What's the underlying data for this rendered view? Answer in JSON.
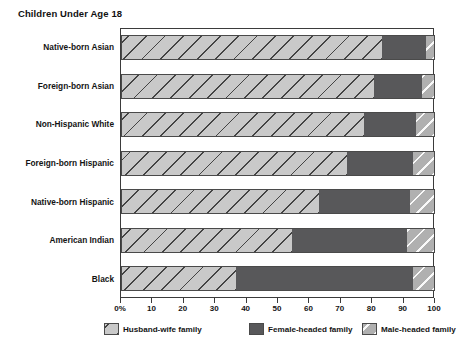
{
  "chart_data": {
    "type": "bar",
    "title": "Children Under Age 18",
    "subtype": "horizontal stacked bar (100% stacked)",
    "xlabel": "",
    "ylabel": "",
    "xlim": [
      0,
      100
    ],
    "grid": false,
    "legend_position": "bottom",
    "orientation": "horizontal",
    "stacked": true,
    "categories": [
      "Native-born Asian",
      "Foreign-born Asian",
      "Non-Hispanic White",
      "Foreign-born Hispanic",
      "Native-born Hispanic",
      "American Indian",
      "Black"
    ],
    "series": [
      {
        "name": "Husband-wife family",
        "color": "#c9c9c9",
        "pattern": "diagonal-hatch-dark",
        "values": [
          83,
          80.5,
          77.5,
          72,
          63,
          54.5,
          36.5
        ]
      },
      {
        "name": "Female-headed family",
        "color": "#58585a",
        "pattern": "solid",
        "values": [
          14,
          15.5,
          16.5,
          21,
          29,
          36.5,
          56.5
        ]
      },
      {
        "name": "Male-headed family",
        "color": "#b0b0b0",
        "pattern": "diagonal-hatch-light",
        "values": [
          3,
          4,
          6,
          7,
          8,
          9,
          7
        ]
      }
    ],
    "xticks": [
      0,
      10,
      20,
      30,
      40,
      50,
      60,
      70,
      80,
      90,
      100
    ],
    "xtick_labels": [
      "0%",
      "10",
      "20",
      "30",
      "40",
      "50",
      "60",
      "70",
      "80",
      "90",
      "100"
    ]
  },
  "legend": {
    "items": [
      {
        "label": "Husband-wife family"
      },
      {
        "label": "Female-headed family"
      },
      {
        "label": "Male-headed family"
      }
    ]
  },
  "footnote": {
    "text": ""
  }
}
